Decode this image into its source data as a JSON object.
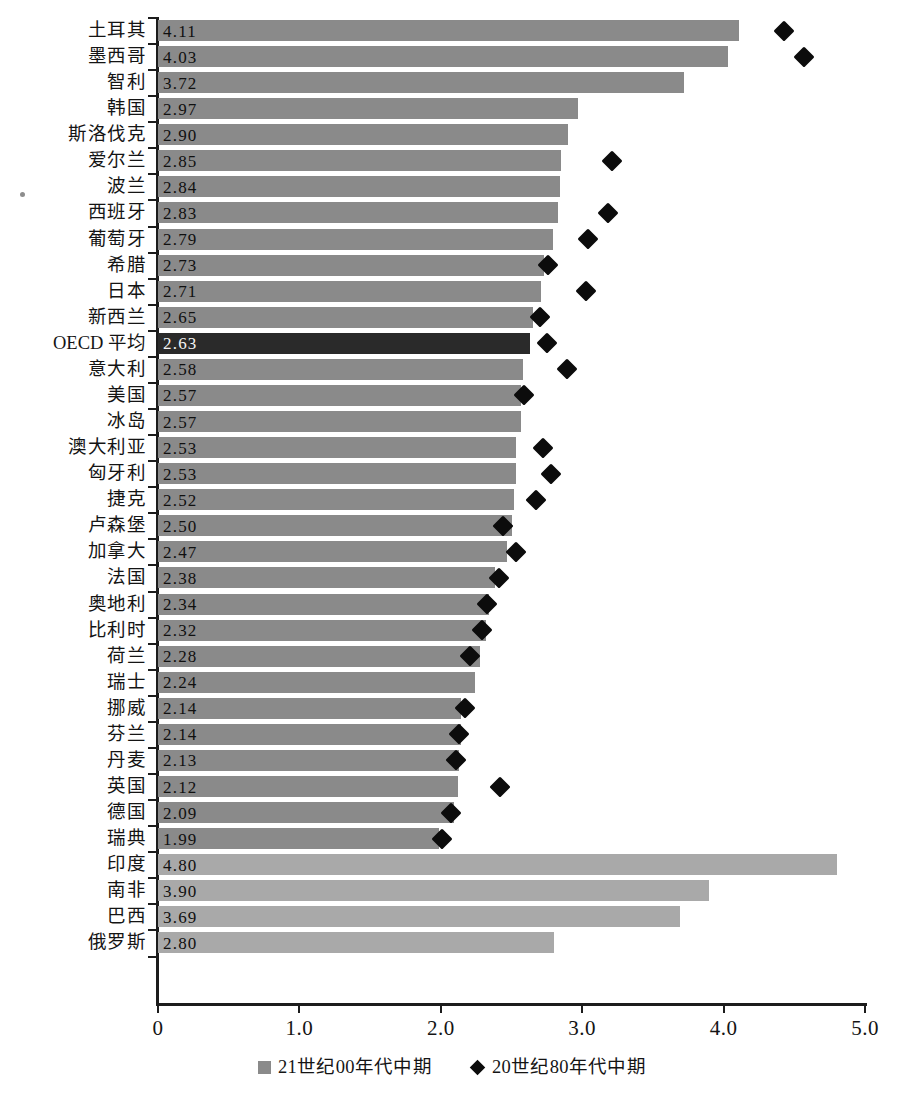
{
  "chart_data": {
    "type": "bar",
    "title": "",
    "xlabel": "",
    "ylabel": "",
    "xlim": [
      0,
      5.0
    ],
    "grid": false,
    "orientation": "horizontal",
    "legend_position": "bottom-center",
    "xticks": [
      "0",
      "1.0",
      "2.0",
      "3.0",
      "4.0",
      "5.0"
    ],
    "xtick_values": [
      0,
      1.0,
      2.0,
      3.0,
      4.0,
      5.0
    ],
    "series": [
      {
        "name": "21世纪00年代中期",
        "marker": "square",
        "color": "#8a8a8a"
      },
      {
        "name": "20世纪80年代中期",
        "marker": "diamond",
        "color": "#0c0c0c"
      }
    ],
    "categories": [
      "土耳其",
      "墨西哥",
      "智利",
      "韩国",
      "斯洛伐克",
      "爱尔兰",
      "波兰",
      "西班牙",
      "葡萄牙",
      "希腊",
      "日本",
      "新西兰",
      "OECD 平均",
      "意大利",
      "美国",
      "冰岛",
      "澳大利亚",
      "匈牙利",
      "捷克",
      "卢森堡",
      "加拿大",
      "法国",
      "奥地利",
      "比利时",
      "荷兰",
      "瑞士",
      "挪威",
      "芬兰",
      "丹麦",
      "英国",
      "德国",
      "瑞典",
      "印度",
      "南非",
      "巴西",
      "俄罗斯"
    ],
    "values": [
      4.11,
      4.03,
      3.72,
      2.97,
      2.9,
      2.85,
      2.84,
      2.83,
      2.79,
      2.73,
      2.71,
      2.65,
      2.63,
      2.58,
      2.57,
      2.57,
      2.53,
      2.53,
      2.52,
      2.5,
      2.47,
      2.38,
      2.34,
      2.32,
      2.28,
      2.24,
      2.14,
      2.14,
      2.13,
      2.12,
      2.09,
      1.99,
      4.8,
      3.9,
      3.69,
      2.8
    ],
    "value_labels": [
      "4.11",
      "4.03",
      "3.72",
      "2.97",
      "2.90",
      "2.85",
      "2.84",
      "2.83",
      "2.79",
      "2.73",
      "2.71",
      "2.65",
      "2.63",
      "2.58",
      "2.57",
      "2.57",
      "2.53",
      "2.53",
      "2.52",
      "2.50",
      "2.47",
      "2.38",
      "2.34",
      "2.32",
      "2.28",
      "2.24",
      "2.14",
      "2.14",
      "2.13",
      "2.12",
      "2.09",
      "1.99",
      "4.80",
      "3.90",
      "3.69",
      "2.80"
    ],
    "marker_values": [
      4.43,
      4.57,
      null,
      null,
      null,
      3.21,
      null,
      3.18,
      3.04,
      2.76,
      3.03,
      2.7,
      2.75,
      2.89,
      2.59,
      null,
      2.72,
      2.78,
      2.67,
      2.44,
      2.53,
      2.41,
      2.33,
      2.29,
      2.21,
      null,
      2.17,
      2.13,
      2.11,
      2.42,
      2.07,
      2.01,
      null,
      null,
      null,
      null
    ],
    "bar_styles": [
      "default",
      "default",
      "default",
      "default",
      "default",
      "default",
      "default",
      "default",
      "default",
      "default",
      "default",
      "default",
      "oecd",
      "default",
      "default",
      "default",
      "default",
      "default",
      "default",
      "default",
      "default",
      "default",
      "default",
      "default",
      "default",
      "default",
      "default",
      "default",
      "default",
      "default",
      "default",
      "default",
      "bric",
      "bric",
      "bric",
      "bric"
    ]
  },
  "legend": {
    "items": [
      {
        "label": "21世纪00年代中期",
        "marker": "square-swatch"
      },
      {
        "label": "20世纪80年代中期",
        "marker": "diamond-swatch"
      }
    ]
  },
  "colors": {
    "bar": "#8a8a8a",
    "bar_highlight": "#2a2a2a",
    "bar_bric": "#a9a9a9",
    "marker": "#0c0c0c",
    "axis": "#1c1c1c",
    "text": "#141414",
    "background": "#ffffff"
  }
}
